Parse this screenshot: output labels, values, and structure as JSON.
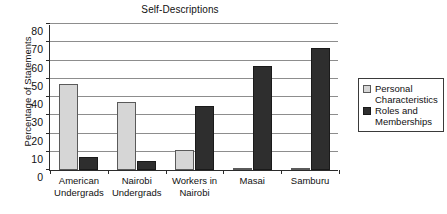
{
  "chart_data": {
    "type": "bar",
    "title": "Self-Descriptions",
    "xlabel": "",
    "ylabel": "Percentage of Statements",
    "ylim": [
      0,
      80
    ],
    "ytick_step": 10,
    "yticks": [
      "80",
      "70",
      "60",
      "50",
      "40",
      "30",
      "20",
      "10",
      "0"
    ],
    "grid": true,
    "legend_position": "right",
    "categories": [
      "American\nUndergrads",
      "Nairobi\nUndergrads",
      "Workers in\nNairobi",
      "Masai",
      "Samburu"
    ],
    "series": [
      {
        "name": "Personal\nCharacteristics",
        "color": "#d6d6d6",
        "values": [
          47,
          37,
          11,
          1,
          0.5
        ]
      },
      {
        "name": "Roles and\nMemberships",
        "color": "#2e2e2e",
        "values": [
          7,
          5,
          35,
          57,
          67
        ]
      }
    ]
  }
}
